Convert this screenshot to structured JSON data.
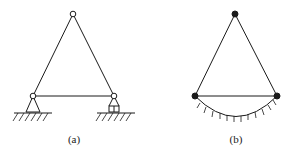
{
  "figures": [
    {
      "id": "a",
      "label": "(a)",
      "description": "Triangular truss with hinged joints on pin and roller supports",
      "nodes": [
        {
          "name": "top",
          "x": 73,
          "y": 14,
          "style": "open-hinge"
        },
        {
          "name": "bottom-left",
          "x": 33,
          "y": 96,
          "style": "open-hinge"
        },
        {
          "name": "bottom-right",
          "x": 114,
          "y": 96,
          "style": "open-hinge"
        }
      ],
      "supports": [
        {
          "type": "pin",
          "at": "bottom-left"
        },
        {
          "type": "roller",
          "at": "bottom-right"
        }
      ]
    },
    {
      "id": "b",
      "label": "(b)",
      "description": "Triangle with rigid (filled) nodes, base connected to curved ground",
      "nodes": [
        {
          "name": "top",
          "x": 235,
          "y": 14,
          "style": "filled-node"
        },
        {
          "name": "bottom-left",
          "x": 195,
          "y": 96,
          "style": "filled-node"
        },
        {
          "name": "bottom-right",
          "x": 277,
          "y": 96,
          "style": "filled-node"
        }
      ],
      "ground": {
        "type": "curved-arc-with-ticks"
      }
    }
  ],
  "colors": {
    "stroke": "#1a1a1a",
    "background": "#ffffff"
  }
}
